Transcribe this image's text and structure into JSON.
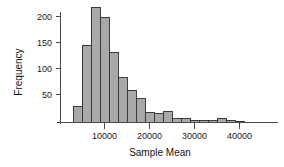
{
  "chart_data": {
    "type": "bar",
    "title": "",
    "xlabel": "Sample Mean",
    "ylabel": "Frequency",
    "xlim": [
      2000,
      43000
    ],
    "ylim": [
      0,
      225
    ],
    "grid": false,
    "legend": null,
    "bin_width": 2000,
    "bar_color": "#a9a9a9",
    "bar_edge_color": "#2b2b2b",
    "axis_color": "#4a4a4a",
    "xticks": [
      10000,
      20000,
      30000,
      40000
    ],
    "xtick_labels": [
      "10000",
      "20000",
      "30000",
      "40000"
    ],
    "yticks": [
      50,
      100,
      150,
      200
    ],
    "ytick_labels": [
      "50",
      "100",
      "150",
      "200"
    ],
    "bin_starts": [
      3000,
      5000,
      7000,
      9000,
      11000,
      13000,
      15000,
      17000,
      19000,
      21000,
      23000,
      25000,
      27000,
      29000,
      31000,
      33000,
      35000,
      37000,
      39000
    ],
    "categories": [
      "3000",
      "5000",
      "7000",
      "9000",
      "11000",
      "13000",
      "15000",
      "17000",
      "19000",
      "21000",
      "23000",
      "25000",
      "27000",
      "29000",
      "31000",
      "33000",
      "35000",
      "37000",
      "39000"
    ],
    "values": [
      30,
      146,
      217,
      199,
      133,
      84,
      61,
      45,
      19,
      17,
      20,
      7,
      7,
      4,
      4,
      3,
      8,
      4,
      2
    ]
  }
}
